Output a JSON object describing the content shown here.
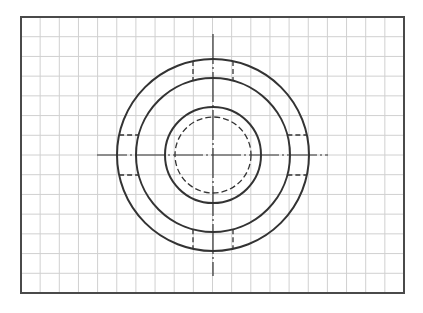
{
  "drawing": {
    "type": "technical-drawing-circular-part-top-view",
    "frame": {
      "x": 21,
      "y": 17,
      "width": 383,
      "height": 276,
      "stroke": "#4a4a4a"
    },
    "grid": {
      "cols": 20,
      "rows": 14,
      "stroke": "#d0d0d0"
    },
    "center": {
      "x": 213,
      "y": 155
    },
    "circles": [
      {
        "name": "outer-circle",
        "r": 96,
        "style": "solid"
      },
      {
        "name": "second-circle",
        "r": 77,
        "style": "solid"
      },
      {
        "name": "bore-circle",
        "r": 48,
        "style": "solid"
      },
      {
        "name": "hidden-circle",
        "r": 38,
        "style": "dashed"
      }
    ],
    "centerlines": {
      "horizontal": {
        "x1": 97,
        "x2": 328
      },
      "vertical": {
        "y1": 34,
        "y2": 276
      }
    },
    "slot_hidden_offset": 20,
    "line_color": "#333333"
  }
}
